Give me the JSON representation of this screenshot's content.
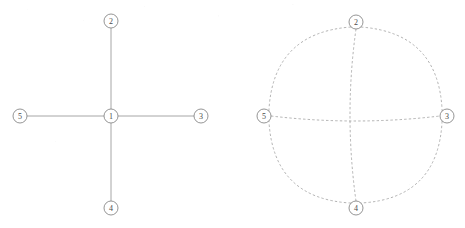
{
  "figure": {
    "caption": "",
    "background_color": "#ffffff",
    "width": 465,
    "height": 228
  },
  "style": {
    "node_fill": "#ffffff",
    "node_stroke": "#7a7a7a",
    "node_radius": 7,
    "label_color": "#4a4a4a",
    "solid_edge_color": "#8a8a8a",
    "dashed_edge_color": "#9a9a9a",
    "dash_pattern": "2.4 2.2"
  },
  "panels": [
    {
      "id": "left-panel",
      "name": "star-graph",
      "edge_style": "solid",
      "nodes": [
        {
          "id": "1",
          "label": "1",
          "x": 111,
          "y": 116
        },
        {
          "id": "2",
          "label": "2",
          "x": 111,
          "y": 21
        },
        {
          "id": "3",
          "label": "3",
          "x": 201,
          "y": 116
        },
        {
          "id": "4",
          "label": "4",
          "x": 111,
          "y": 208
        },
        {
          "id": "5",
          "label": "5",
          "x": 20,
          "y": 116
        }
      ],
      "edges": [
        {
          "from": "1",
          "to": "2",
          "curve": 0
        },
        {
          "from": "1",
          "to": "3",
          "curve": 0
        },
        {
          "from": "1",
          "to": "4",
          "curve": 0
        },
        {
          "from": "1",
          "to": "5",
          "curve": 0
        }
      ]
    },
    {
      "id": "right-panel",
      "name": "cycle-graph",
      "edge_style": "dashed",
      "nodes": [
        {
          "id": "2",
          "label": "2",
          "x": 356,
          "y": 22
        },
        {
          "id": "3",
          "label": "3",
          "x": 447,
          "y": 116
        },
        {
          "id": "4",
          "label": "4",
          "x": 356,
          "y": 208
        },
        {
          "id": "5",
          "label": "5",
          "x": 264,
          "y": 116
        }
      ],
      "edges": [
        {
          "from": "5",
          "to": "2",
          "curve": 26
        },
        {
          "from": "2",
          "to": "3",
          "curve": 26
        },
        {
          "from": "3",
          "to": "4",
          "curve": 26
        },
        {
          "from": "4",
          "to": "5",
          "curve": 26
        },
        {
          "from": "5",
          "to": "3",
          "curve": 5
        },
        {
          "from": "2",
          "to": "4",
          "curve": -6
        }
      ]
    }
  ]
}
